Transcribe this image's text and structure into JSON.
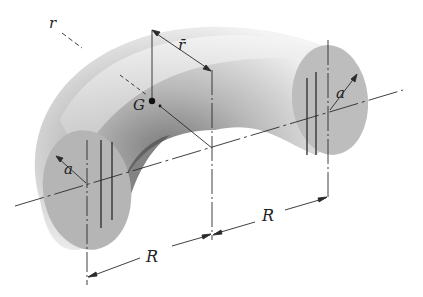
{
  "figure": {
    "type": "technical-diagram"
  },
  "labels": {
    "r": "r",
    "r_bar": "r̄",
    "G": "G",
    "a_left": "a",
    "a_right": "a",
    "R_left": "R",
    "R_right": "R"
  },
  "colors": {
    "line": "#2a2a2a",
    "section_fill": "#b9b9b9",
    "shade_dark": "#6e6e6e",
    "shade_light": "#f2f2f2"
  }
}
